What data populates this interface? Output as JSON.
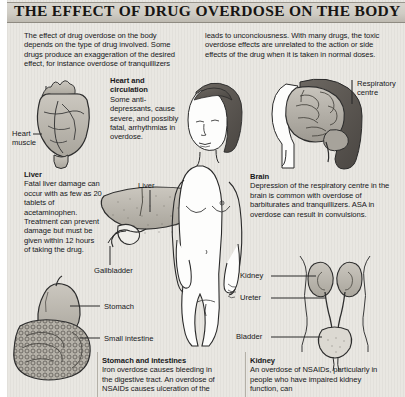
{
  "title": "THE EFFECT OF DRUG OVERDOSE ON THE BODY",
  "intro": {
    "column_left": "The effect of drug overdose on the body depends on the type of drug involved. Some drugs produce an exaggeration of the desired effect, for instance overdose of tranquillizers",
    "column_right": "leads to unconciousness. With many drugs, the toxic overdose effects are unrelated to the action or side effects of the drug when it is taken in normal doses."
  },
  "sections": {
    "heart": {
      "heading": "Heart and circulation",
      "body": "Some anti-depressants, cause severe, and possibly fatal, arrhythmias in overdose."
    },
    "liver": {
      "heading": "Liver",
      "body": "Fatal liver damage can occur with as few as 20 tablets of acetaminophen. Treatment can prevent damage but must be given within 12 hours of taking the drug."
    },
    "brain": {
      "heading": "Brain",
      "body": "Depression of the respiratory centre in the brain is common with overdose of barbiturates and tranquillizers. ASA in overdose can result in convulsions."
    },
    "stomach": {
      "heading": "Stomach and intestines",
      "body": "Iron overdose causes bleeding in the digestive tract. An overdose of NSAIDs causes ulceration of the"
    },
    "kidney": {
      "heading": "Kidney",
      "body": "An overdose of NSAIDs, particularly in people who have impaired kidney function, can"
    }
  },
  "callouts": {
    "heart_muscle": "Heart\nmuscle",
    "heart_muscle_line1": "Heart",
    "heart_muscle_line2": "muscle",
    "liver_organ": "Liver",
    "gallbladder": "Gallbladder",
    "stomach": "Stomach",
    "small_intestine": "Small intestine",
    "respiratory_centre_line1": "Respiratory",
    "respiratory_centre_line2": "centre",
    "kidney": "Kidney",
    "ureter": "Ureter",
    "bladder": "Bladder"
  },
  "colors": {
    "paper": "#e9e7e2",
    "title_bar": "#cfccc4",
    "ink": "#17171a",
    "organ_fill": "#b9b5ad",
    "skin": "#ffffff"
  }
}
